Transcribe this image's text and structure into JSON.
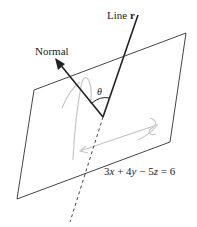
{
  "diagram": {
    "labels": {
      "line": "Line",
      "line_symbol": "r",
      "normal": "Normal",
      "angle": "θ",
      "equation": "3x + 4y − 5z = 6"
    },
    "equation_parts": {
      "a": "3",
      "x": "x",
      "op1": "+",
      "b": "4",
      "y": "y",
      "op2": "−",
      "c": "5",
      "z": "z",
      "eq": "=",
      "rhs": "6"
    },
    "colors": {
      "stroke": "#222222",
      "sketch": "#c8c8c8",
      "background": "#ffffff"
    }
  }
}
